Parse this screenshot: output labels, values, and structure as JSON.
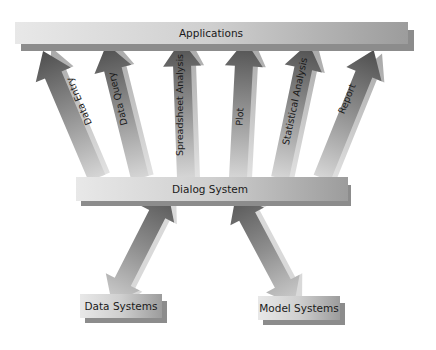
{
  "diagram": {
    "top_box": {
      "label": "Applications"
    },
    "middle_box": {
      "label": "Dialog System"
    },
    "bottom_boxes": [
      {
        "label": "Data Systems"
      },
      {
        "label": "Model Systems"
      }
    ],
    "application_arrows": [
      {
        "label": "Data Entry"
      },
      {
        "label": "Data Query"
      },
      {
        "label": "Spreadsheet Analysis"
      },
      {
        "label": "Plot"
      },
      {
        "label": "Statistical Analysis"
      },
      {
        "label": "Report"
      }
    ],
    "connections": [
      {
        "from": "Dialog System",
        "to": "Applications",
        "count": 6,
        "direction": "up"
      },
      {
        "from": "Dialog System",
        "to": "Data Systems",
        "direction": "bidirectional"
      },
      {
        "from": "Dialog System",
        "to": "Model Systems",
        "direction": "bidirectional"
      }
    ],
    "colors": {
      "box_light": "#e6e6e6",
      "box_dark": "#9a9a9a",
      "shadow": "#8a8a8a",
      "arrow_dark": "#555555",
      "arrow_light": "#d2d2d2",
      "text": "#1a1a1a"
    }
  }
}
